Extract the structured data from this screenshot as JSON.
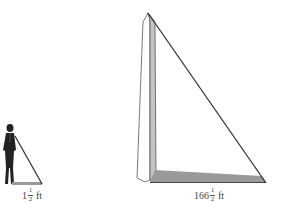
{
  "figure": {
    "person": {
      "shadow_label": {
        "whole": "1",
        "numerator": "1",
        "denominator": "2",
        "unit": "ft"
      }
    },
    "monument": {
      "shadow_label": {
        "whole": "166",
        "numerator": "1",
        "denominator": "2",
        "unit": "ft"
      }
    }
  },
  "colors": {
    "line": "#333333",
    "shadow_fill": "#9a9a9a",
    "monument_light": "#ffffff",
    "monument_dark": "#c4c4c4",
    "person": "#222222"
  }
}
